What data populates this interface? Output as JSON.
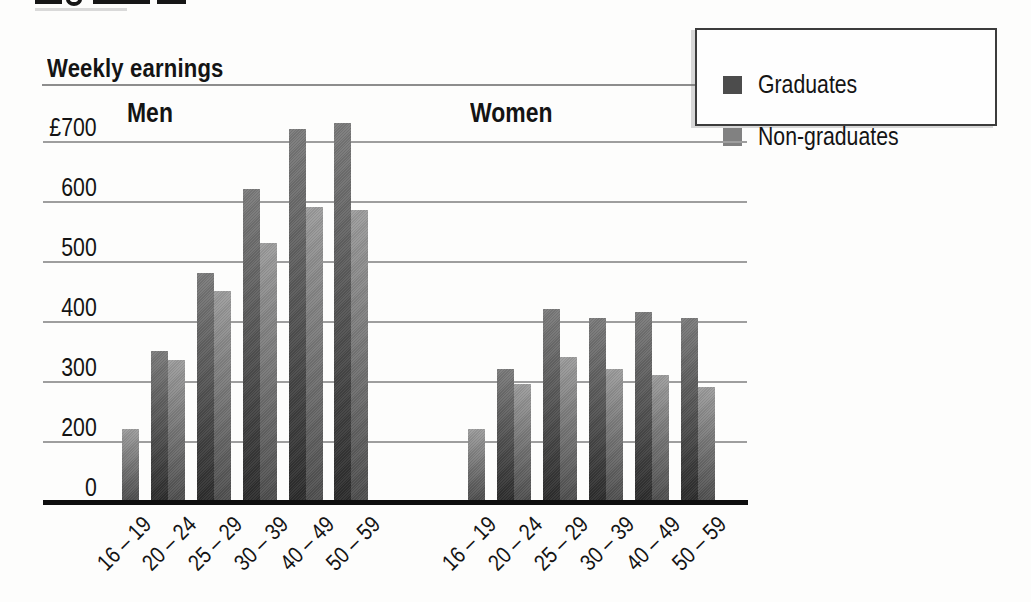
{
  "chart_data": {
    "type": "bar",
    "title": "Weekly earnings",
    "currency_symbol": "£",
    "legend_position": "top-right",
    "gridlines": true,
    "x_label_rotation_deg": -45,
    "legend": [
      {
        "label": "Graduates",
        "color": "#4c4c4c"
      },
      {
        "label": "Non-graduates",
        "color": "#818181"
      }
    ],
    "y_axis": {
      "tick_labels": [
        "£700",
        "600",
        "500",
        "400",
        "300",
        "200",
        "0"
      ],
      "tick_values": [
        700,
        600,
        500,
        400,
        300,
        200,
        0
      ],
      "range": [
        0,
        700
      ],
      "broken_scale_between_0_and_200": true
    },
    "categories": [
      "16 – 19",
      "20 – 24",
      "25 – 29",
      "30 – 39",
      "40 – 49",
      "50 – 59"
    ],
    "groups": [
      {
        "label": "Men",
        "series": [
          {
            "name": "Graduates",
            "values": [
              null,
              350,
              480,
              620,
              720,
              730
            ]
          },
          {
            "name": "Non-graduates",
            "values": [
              220,
              335,
              450,
              530,
              590,
              585
            ]
          }
        ]
      },
      {
        "label": "Women",
        "series": [
          {
            "name": "Graduates",
            "values": [
              null,
              320,
              420,
              405,
              415,
              405
            ]
          },
          {
            "name": "Non-graduates",
            "values": [
              220,
              295,
              340,
              320,
              310,
              290
            ]
          }
        ]
      }
    ],
    "bar_colors": {
      "graduates_gradient": [
        "#7b7b7b",
        "#2c2c2c"
      ],
      "non_graduates_gradient": [
        "#9d9d9d",
        "#4e4e4e"
      ]
    }
  }
}
